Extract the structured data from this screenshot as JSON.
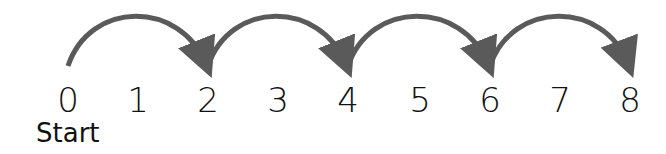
{
  "diagram": {
    "numbers": [
      "0",
      "1",
      "2",
      "3",
      "4",
      "5",
      "6",
      "7",
      "8"
    ],
    "start_label": "Start",
    "jumps": [
      {
        "from": 0,
        "to": 2
      },
      {
        "from": 2,
        "to": 4
      },
      {
        "from": 4,
        "to": 6
      },
      {
        "from": 6,
        "to": 8
      }
    ],
    "arrow_color": "#5a5a5a",
    "text_color": "#111111"
  }
}
